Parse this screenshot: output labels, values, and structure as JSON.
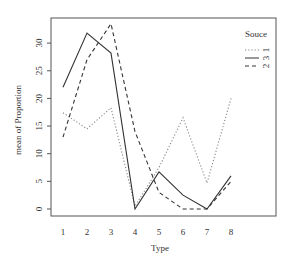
{
  "chart_data": {
    "type": "line",
    "title": "",
    "xlabel": "Type",
    "ylabel": "mean of Proportion",
    "categories": [
      "1",
      "2",
      "3",
      "4",
      "5",
      "6",
      "7",
      "8"
    ],
    "x": [
      1,
      2,
      3,
      4,
      5,
      6,
      7,
      8
    ],
    "yticks": [
      0,
      5,
      10,
      15,
      20,
      25,
      30
    ],
    "ylim": [
      0,
      34
    ],
    "grid": false,
    "legend": {
      "title": "Souce",
      "position": "top-right-inside",
      "entries": [
        {
          "label": "1",
          "style": "dotted"
        },
        {
          "label": "3",
          "style": "solid"
        },
        {
          "label": "2",
          "style": "dashed"
        }
      ]
    },
    "series": [
      {
        "name": "1",
        "style": "dotted",
        "values": [
          17.4,
          14.5,
          18.3,
          0.5,
          7.5,
          16.5,
          4.7,
          20.0
        ]
      },
      {
        "name": "3",
        "style": "solid",
        "values": [
          22.0,
          31.8,
          28.2,
          0.0,
          6.7,
          2.5,
          0.0,
          6.0
        ]
      },
      {
        "name": "2",
        "style": "dashed",
        "values": [
          13.0,
          27.0,
          33.5,
          14.0,
          3.0,
          0.0,
          0.0,
          5.0
        ]
      }
    ]
  },
  "colors": {
    "line": "#333333",
    "axis": "#555555",
    "background": "#ffffff"
  }
}
